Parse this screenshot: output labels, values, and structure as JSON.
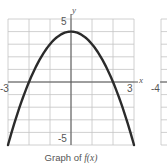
{
  "chart_data": {
    "type": "line",
    "title": "Graph of f(x)",
    "function": "f(x) = 4 - x^2",
    "xlabel": "x",
    "ylabel": "y",
    "xlim": [
      -3,
      3
    ],
    "ylim": [
      -5,
      5
    ],
    "grid": true,
    "x_tick_labels": [
      "-3",
      "3"
    ],
    "y_tick_labels": [
      "5",
      "-5"
    ],
    "series": [
      {
        "name": "f(x)",
        "x": [
          -3,
          -2.5,
          -2,
          -1.5,
          -1,
          -0.5,
          0,
          0.5,
          1,
          1.5,
          2,
          2.5,
          3
        ],
        "y": [
          -5,
          -2.25,
          0,
          1.75,
          3,
          3.75,
          4,
          3.75,
          3,
          1.75,
          0,
          -2.25,
          -5
        ]
      }
    ],
    "partial_neighbor_graph": {
      "x_tick_label": "-4"
    }
  },
  "labels": {
    "y_top": "5",
    "y_bottom": "-5",
    "x_left": "-3",
    "x_right": "3",
    "x_axis_name": "x",
    "y_axis_name": "y",
    "neighbor_x_left": "-4",
    "caption_prefix": "Graph of ",
    "caption_func": "f(x)"
  },
  "colors": {
    "curve": "#2b2b2b",
    "grid": "#c4c4c4",
    "axis": "#555555",
    "text": "#555555"
  }
}
